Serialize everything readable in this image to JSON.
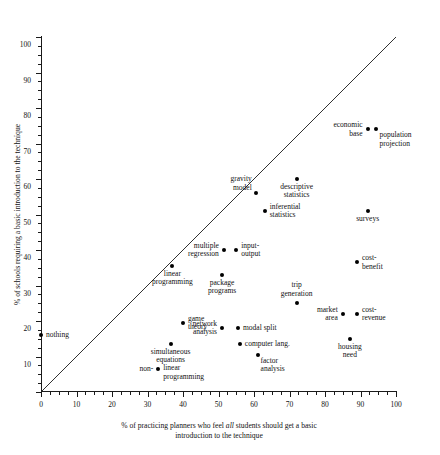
{
  "chart_data": {
    "type": "scatter",
    "title": "",
    "xlabel": "% of practicing planners who feel all students should get a basic introduction to the technique",
    "xlabel_line1_pre": "% of practicing planners who feel ",
    "xlabel_emphasis": "all",
    "xlabel_line1_post": " students should get a basic",
    "xlabel_line2": "introduction to the technique",
    "ylabel": "% of schools requiring a basic introduction to the technique",
    "xlim": [
      0,
      100
    ],
    "ylim": [
      0,
      100
    ],
    "xticks": [
      0,
      10,
      20,
      30,
      40,
      50,
      60,
      70,
      80,
      90,
      100
    ],
    "yticks": [
      0,
      10,
      20,
      30,
      40,
      50,
      60,
      70,
      80,
      90,
      100
    ],
    "minor_tick_step": 2.5,
    "grid": false,
    "legend": null,
    "reference_line": {
      "name": "identity-line",
      "type": "y=x",
      "from": [
        0,
        0
      ],
      "to": [
        100,
        100
      ]
    },
    "point_color": "#000000",
    "points": [
      {
        "label": "nothing",
        "x": 0,
        "y": 16,
        "anchor": "e"
      },
      {
        "label": "non-  linear\nprogramming",
        "x": 33,
        "y": 6.5,
        "anchor": "sw_split",
        "label_left": "non-",
        "label_right": "linear\nprogramming"
      },
      {
        "label": "simultaneous\nequations",
        "x": 36.5,
        "y": 13.5,
        "anchor": "s"
      },
      {
        "label": "game\ntheory",
        "x": 40,
        "y": 19.5,
        "anchor": "e"
      },
      {
        "label": "network\nanalysis",
        "x": 51,
        "y": 18,
        "anchor": "w"
      },
      {
        "label": "modal split",
        "x": 55.5,
        "y": 18,
        "anchor": "e"
      },
      {
        "label": "computer lang.",
        "x": 56,
        "y": 13.5,
        "anchor": "e"
      },
      {
        "label": "factor\nanalysis",
        "x": 61,
        "y": 10.5,
        "anchor": "se"
      },
      {
        "label": "linear\nprogramming",
        "x": 37,
        "y": 35.5,
        "anchor": "s"
      },
      {
        "label": "package\nprograms",
        "x": 51,
        "y": 33,
        "anchor": "s"
      },
      {
        "label": "multiple\nregression",
        "x": 51.5,
        "y": 40,
        "anchor": "w"
      },
      {
        "label": "input-\noutput",
        "x": 55,
        "y": 40,
        "anchor": "e"
      },
      {
        "label": "gravity\nmodel",
        "x": 60.5,
        "y": 56,
        "anchor": "nw"
      },
      {
        "label": "inferential\nstatistics",
        "x": 63,
        "y": 51,
        "anchor": "e"
      },
      {
        "label": "descriptive\nstatistics",
        "x": 72,
        "y": 60,
        "anchor": "s"
      },
      {
        "label": "trip\ngeneration",
        "x": 72,
        "y": 25,
        "anchor": "n"
      },
      {
        "label": "market\narea",
        "x": 85,
        "y": 22,
        "anchor": "w"
      },
      {
        "label": "cost-\nrevenue",
        "x": 89,
        "y": 22,
        "anchor": "e"
      },
      {
        "label": "housing\nneed",
        "x": 87,
        "y": 15,
        "anchor": "s"
      },
      {
        "label": "cost-\nbenefit",
        "x": 89,
        "y": 36.5,
        "anchor": "e"
      },
      {
        "label": "surveys",
        "x": 92,
        "y": 51,
        "anchor": "s"
      },
      {
        "label": "economic\nbase",
        "x": 92,
        "y": 74,
        "anchor": "w"
      },
      {
        "label": "population\nprojection",
        "x": 94.5,
        "y": 74,
        "anchor": "se"
      }
    ]
  }
}
